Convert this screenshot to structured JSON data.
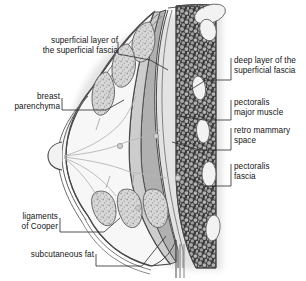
{
  "figure": {
    "orientation": "Nipple at left, chest wall and ribs at right"
  },
  "labels": {
    "superficial_layer": "superficial layer of\nthe superficial fascia",
    "superficial_layer_line1": "superficial layer of",
    "superficial_layer_line2": "the superficial fascia",
    "breast_parenchyma_line1": "breast",
    "breast_parenchyma_line2": "parenchyma",
    "ligaments_line1": "ligaments",
    "ligaments_line2": "of Cooper",
    "subcutaneous_fat": "subcutaneous fat",
    "deep_layer_line1": "deep layer of the",
    "deep_layer_line2": "superficial fascia",
    "pectoralis_major_line1": "pectoralis",
    "pectoralis_major_line2": "major muscle",
    "retro_mammary_line1": "retro mammary",
    "retro_mammary_line2": "space",
    "pectoralis_fascia_line1": "pectoralis",
    "pectoralis_fascia_line2": "fascia"
  },
  "colors": {
    "outline": "#4a4a4a",
    "text": "#141414",
    "leader": "#2a2a2a",
    "skin_band": "#e9e9e9",
    "fascia_band": "#d2d2d2",
    "parenchyma_fill": "#f7f7f7",
    "lobule_fill": "#d8d8d8",
    "lobule_stipple": "#9a9a9a",
    "muscle_fill": "#b0b0b0",
    "retro_space": "#cdcdcd",
    "intercostal_dark": "#3b3b3b",
    "intercostal_mottle": "#a8a8a8",
    "rib_fill": "#f2f2f2",
    "duct_line": "#b5b5b5",
    "shadow": "#c9c9c9"
  },
  "structures": [
    {
      "name": "nipple",
      "note": "rounded apex at left margin"
    },
    {
      "name": "breast-parenchyma",
      "note": "pale central region with branching ducts"
    },
    {
      "name": "fat-lobules",
      "note": "stippled rounded lobules beneath skin"
    },
    {
      "name": "cooper-ligaments",
      "note": "fine septa between lobules and fascia"
    },
    {
      "name": "pectoralis-major-muscle",
      "note": "mid-gray wedge along chest wall"
    },
    {
      "name": "retromammary-space",
      "note": "thin band between breast and muscle"
    },
    {
      "name": "ribs",
      "note": "white ellipses within dark intercostal tissue",
      "count": 5
    }
  ]
}
